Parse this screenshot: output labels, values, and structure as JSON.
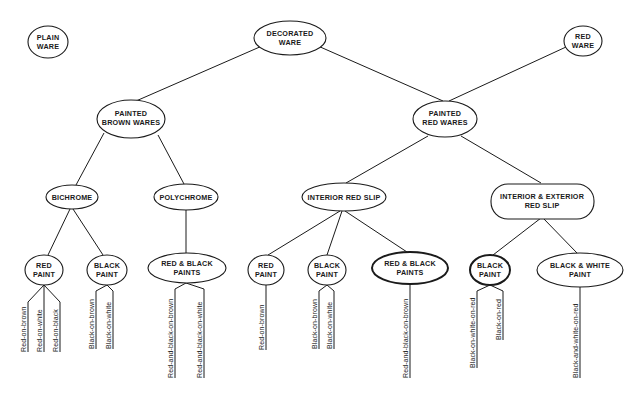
{
  "diagram": {
    "nodes": {
      "plain_ware": {
        "lines": [
          "PLAIN",
          "WARE"
        ]
      },
      "decorated_ware": {
        "lines": [
          "DECORATED",
          "WARE"
        ]
      },
      "red_ware": {
        "lines": [
          "RED",
          "WARE"
        ]
      },
      "painted_brown_wares": {
        "lines": [
          "PAINTED",
          "BROWN WARES"
        ]
      },
      "painted_red_wares": {
        "lines": [
          "PAINTED",
          "RED WARES"
        ]
      },
      "bichrome": {
        "lines": [
          "BICHROME"
        ]
      },
      "polychrome": {
        "lines": [
          "POLYCHROME"
        ]
      },
      "interior_red_slip": {
        "lines": [
          "INTERIOR RED SLIP"
        ]
      },
      "interior_exterior_red_slip": {
        "lines": [
          "INTERIOR & EXTERIOR",
          "RED SLIP"
        ]
      },
      "bichrome_red_paint": {
        "lines": [
          "RED",
          "PAINT"
        ]
      },
      "bichrome_black_paint": {
        "lines": [
          "BLACK",
          "PAINT"
        ]
      },
      "polychrome_red_black_paints": {
        "lines": [
          "RED & BLACK",
          "PAINTS"
        ]
      },
      "irs_red_paint": {
        "lines": [
          "RED",
          "PAINT"
        ]
      },
      "irs_black_paint": {
        "lines": [
          "BLACK",
          "PAINT"
        ]
      },
      "irs_red_black_paints": {
        "lines": [
          "RED & BLACK",
          "PAINTS"
        ]
      },
      "iers_black_paint": {
        "lines": [
          "BLACK",
          "PAINT"
        ]
      },
      "iers_black_white_paint": {
        "lines": [
          "BLACK & WHITE",
          "PAINT"
        ]
      }
    },
    "leaves": {
      "bichrome_red_paint": [
        "Red-on-brown",
        "Red-on-white",
        "Red-on-black"
      ],
      "bichrome_black_paint": [
        "Black-on-brown",
        "Black-on-white"
      ],
      "polychrome_red_black_paints": [
        "Red-and-black-on-brown",
        "Red-and-black-on-white"
      ],
      "irs_red_paint": [
        "Red-on-brown"
      ],
      "irs_black_paint": [
        "Black-on-brown",
        "Black-on-white"
      ],
      "irs_red_black_paints": [
        "Red-and-black-on-brown"
      ],
      "iers_black_paint": [
        "Black-on-white-on-red",
        "Black-on-red"
      ],
      "iers_black_white_paint": [
        "Black-and-white-on-red"
      ]
    },
    "colors": {
      "ink": "#1a1a1a",
      "paper": "#ffffff"
    }
  }
}
